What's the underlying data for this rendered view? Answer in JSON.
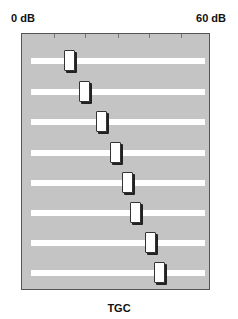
{
  "scale": {
    "min_label": "0 dB",
    "max_label": "60 dB",
    "min_db": 0,
    "max_db": 60
  },
  "caption": "TGC",
  "ticks_x": [
    32,
    63,
    96,
    127,
    159
  ],
  "sliders": [
    {
      "track_y": 24,
      "knob_x": 42
    },
    {
      "track_y": 55,
      "knob_x": 57
    },
    {
      "track_y": 85,
      "knob_x": 74
    },
    {
      "track_y": 116,
      "knob_x": 88
    },
    {
      "track_y": 146,
      "knob_x": 100
    },
    {
      "track_y": 176,
      "knob_x": 108
    },
    {
      "track_y": 206,
      "knob_x": 123
    },
    {
      "track_y": 236,
      "knob_x": 132
    }
  ],
  "colors": {
    "panel": "#c4c4c4",
    "track": "#ffffff",
    "knob": "#ffffff",
    "shadow": "#222222"
  }
}
